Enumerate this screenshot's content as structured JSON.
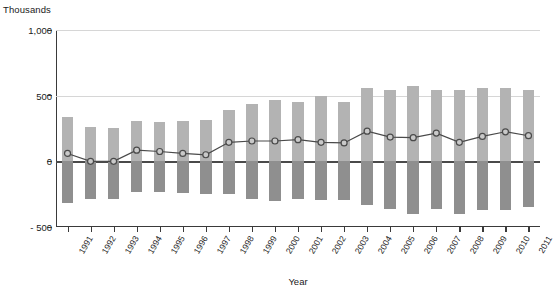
{
  "chart_data": {
    "type": "bar",
    "title": "",
    "subtitle": "",
    "unit_label": "Thousands",
    "xlabel": "Year",
    "ylabel": "",
    "ylim": [
      -500,
      1000
    ],
    "yticks": [
      -500,
      0,
      500,
      1000
    ],
    "ytick_labels": [
      "- 500",
      "0",
      "500",
      "1,000"
    ],
    "grid": true,
    "legend_position": "none",
    "categories": [
      "1991",
      "1992",
      "1993",
      "1994",
      "1995",
      "1996",
      "1997",
      "1998",
      "1999",
      "2000",
      "2001",
      "2002",
      "2003",
      "2004",
      "2005",
      "2006",
      "2007",
      "2008",
      "2009",
      "2010",
      "2011"
    ],
    "series": [
      {
        "name": "Inflows",
        "type": "bar-positive",
        "color": "#b3b3b3",
        "values": [
          335,
          260,
          255,
          310,
          300,
          305,
          315,
          390,
          440,
          465,
          450,
          495,
          450,
          560,
          545,
          570,
          545,
          545,
          560,
          560,
          545
        ]
      },
      {
        "name": "Outflows",
        "type": "bar-negative",
        "color": "#8f8f8f",
        "values": [
          -320,
          -285,
          -290,
          -235,
          -235,
          -240,
          -250,
          -250,
          -290,
          -305,
          -290,
          -295,
          -295,
          -330,
          -360,
          -400,
          -360,
          -400,
          -370,
          -370,
          -345
        ]
      },
      {
        "name": "Net change",
        "type": "line",
        "color": "#4a4a4a",
        "marker": "circle",
        "values": [
          60,
          0,
          0,
          85,
          75,
          60,
          50,
          145,
          155,
          155,
          165,
          145,
          140,
          230,
          185,
          180,
          215,
          145,
          190,
          225,
          195
        ]
      }
    ]
  }
}
